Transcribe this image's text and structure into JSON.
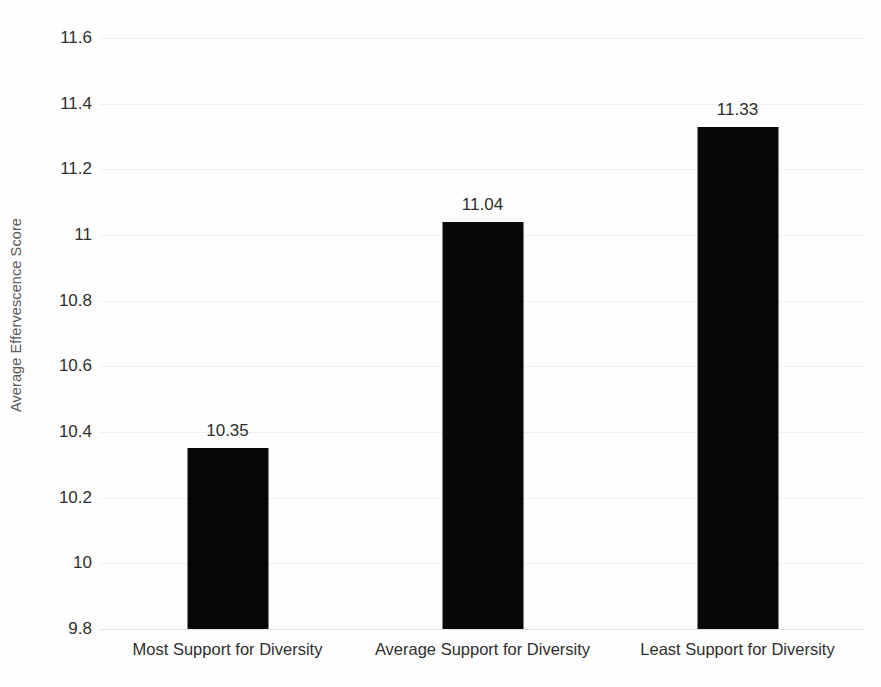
{
  "chart_data": {
    "type": "bar",
    "title": "",
    "subtitle": "",
    "xlabel": "",
    "ylabel": "Average Effervescence Score",
    "categories": [
      "Most Support for Diversity",
      "Average Support for Diversity",
      "Least Support for Diversity"
    ],
    "values": [
      10.35,
      11.04,
      11.33
    ],
    "data_labels": [
      "10.35",
      "11.04",
      "11.33"
    ],
    "ylim": [
      9.8,
      11.6
    ],
    "yticks": [
      9.8,
      10,
      10.2,
      10.4,
      10.6,
      10.8,
      11,
      11.2,
      11.4,
      11.6
    ],
    "ytick_labels": [
      "9.8",
      "10",
      "10.2",
      "10.4",
      "10.6",
      "10.8",
      "11",
      "11.2",
      "11.4",
      "11.6"
    ],
    "grid": true,
    "grid_axis": "y",
    "legend": false,
    "legend_position": "none",
    "bar_color": "#080808",
    "grid_color": "#f0f0f0",
    "axis_color": "#e3e3e3",
    "background_color": "#fefefe",
    "text_color": "#2e2e2e",
    "axis_title_color": "#5a5a5a"
  }
}
